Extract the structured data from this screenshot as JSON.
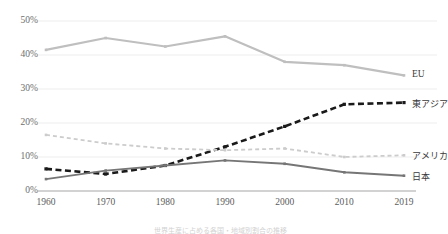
{
  "chart_data": {
    "type": "line",
    "title": "",
    "xlabel": "",
    "ylabel": "",
    "categories": [
      "1960",
      "1970",
      "1980",
      "1990",
      "2000",
      "2010",
      "2019"
    ],
    "ylim": [
      0,
      50
    ],
    "ytick_values": [
      0,
      10,
      20,
      30,
      40,
      50
    ],
    "ytick_labels": [
      "0%",
      "10%",
      "20%",
      "30%",
      "40%",
      "50%"
    ],
    "grid": true,
    "legend_position": "line-end-right",
    "series": [
      {
        "name": "EU",
        "values": [
          41.5,
          45.0,
          42.5,
          45.5,
          38.0,
          37.0,
          34.0
        ],
        "color": "#bfbfbf",
        "style": "solid",
        "width": 2.2,
        "markers": true
      },
      {
        "name": "東アジア",
        "values": [
          6.5,
          5.0,
          7.5,
          13.0,
          19.0,
          25.5,
          26.0
        ],
        "color": "#1a1a1a",
        "style": "dashed",
        "width": 2.6,
        "markers": true
      },
      {
        "name": "アメリカ",
        "values": [
          16.5,
          14.0,
          12.5,
          12.0,
          12.5,
          10.0,
          10.5
        ],
        "color": "#cccccc",
        "style": "dashed",
        "width": 1.8,
        "markers": true
      },
      {
        "name": "日本",
        "values": [
          3.5,
          6.0,
          7.5,
          9.0,
          8.0,
          5.5,
          4.5
        ],
        "color": "#767676",
        "style": "solid",
        "width": 1.9,
        "markers": true
      }
    ]
  },
  "axis": {
    "baseline_color": "#a6a6a6",
    "gridline_color": "#ededed"
  },
  "caption": {
    "text": "世界生産に占める各国・地域別割合の推移"
  }
}
